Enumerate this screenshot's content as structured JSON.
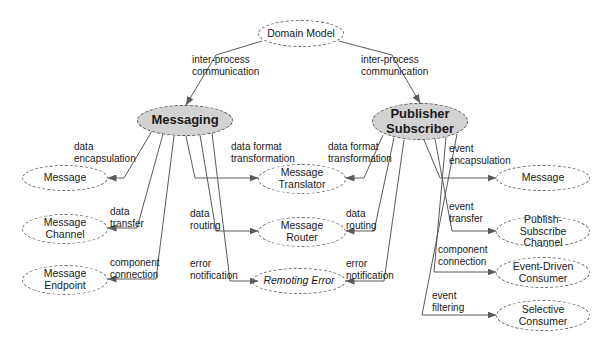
{
  "diagram": {
    "background": "#ffffff",
    "line_color": "#5a5a5a",
    "filled_node_color": "#d2d2d2",
    "nodes": {
      "domain_model": "Domain Model",
      "messaging": "Messaging",
      "publisher_subscriber_line1": "Publisher",
      "publisher_subscriber_line2": "Subscriber",
      "message_left": "Message",
      "message_channel_line1": "Message",
      "message_channel_line2": "Channel",
      "message_endpoint_line1": "Message",
      "message_endpoint_line2": "Endpoint",
      "message_translator_line1": "Message",
      "message_translator_line2": "Translator",
      "message_router_line1": "Message",
      "message_router_line2": "Router",
      "remoting_error": "Remoting Error",
      "message_right": "Message",
      "publish_subscribe_channel_line1": "Publish-Subscribe",
      "publish_subscribe_channel_line2": "Channel",
      "event_driven_consumer_line1": "Event-Driven",
      "event_driven_consumer_line2": "Consumer",
      "selective_consumer_line1": "Selective",
      "selective_consumer_line2": "Consumer"
    },
    "edge_labels": {
      "ipc_left": "inter-process\ncommunication",
      "ipc_right": "inter-process\ncommunication",
      "data_encapsulation": "data\nencapsulation",
      "data_transfer": "data\ntransfer",
      "component_connection_left": "component\nconnection",
      "data_format_transformation_left": "data format\ntransformation",
      "data_routing_left": "data\nrouting",
      "error_notification_left": "error\nnotification",
      "data_format_transformation_right": "data format\ntransformation",
      "data_routing_right": "data\nrouting",
      "error_notification_right": "error\nnotification",
      "event_encapsulation": "event\nencapsulation",
      "event_transfer": "event\ntransfer",
      "component_connection_right": "component\nconnection",
      "event_filtering": "event\nfiltering"
    }
  }
}
